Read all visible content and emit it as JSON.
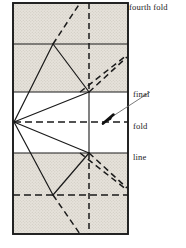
{
  "figure": {
    "title_hidden": "",
    "labels": {
      "fourth_fold": "fourth fold",
      "final_fold_line_1": "final",
      "final_fold_line_2": "fold",
      "final_fold_line_3": "line"
    },
    "colors": {
      "ink": "#1a1a1a",
      "shade": "#dedad3",
      "paper": "#ffffff",
      "leader": "#5a5a5a"
    },
    "geometry": {
      "sheet": {
        "x": 13,
        "y": 3,
        "width": 115,
        "height": 231
      },
      "band_edges_y": [
        3,
        44,
        92,
        153,
        195,
        234
      ],
      "shaded_bands": [
        {
          "y": 3,
          "height": 41
        },
        {
          "y": 44,
          "height": 48
        },
        {
          "y": 153,
          "height": 42
        },
        {
          "y": 195,
          "height": 39
        }
      ],
      "center_vertical_dashed_x": 89,
      "left_vertex": {
        "x": 14,
        "y": 122
      },
      "horizontal_dashed_mid_y": 122,
      "horizontal_dashed_low_y": 195,
      "apex_upper": {
        "x": 53,
        "y": 44
      },
      "apex_lower": {
        "x": 53,
        "y": 195
      },
      "node_upper": {
        "x": 89,
        "y": 92
      },
      "node_lower": {
        "x": 89,
        "y": 153
      },
      "arrow_tip": {
        "x": 103,
        "y": 123
      },
      "leader_end": {
        "x": 150,
        "y": 92
      }
    }
  }
}
